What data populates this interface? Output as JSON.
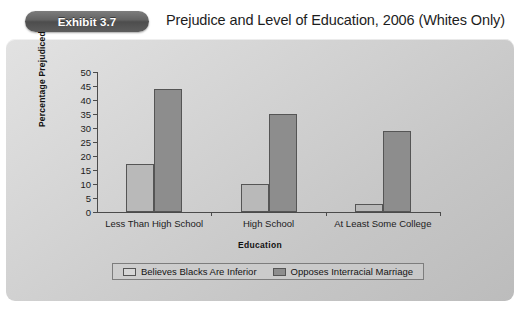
{
  "header": {
    "badge_label": "Exhibit 3.7",
    "title": "Prejudice and Level of Education, 2006 (Whites Only)"
  },
  "legend": {
    "items": [
      {
        "label": "Believes Blacks Are Inferior",
        "swatch": "light",
        "color": "#d6d6d6"
      },
      {
        "label": "Opposes Interracial Marriage",
        "swatch": "dark",
        "color": "#8d8d8d"
      }
    ]
  },
  "colors": {
    "panel_background": "#d2d2d2",
    "bar_light": "#b9b9b9",
    "bar_dark": "#8d8d8d",
    "axis": "#4b4b4b",
    "badge": "#5d5d5d"
  },
  "chart_data": {
    "type": "bar",
    "title": "Prejudice and Level of Education, 2006 (Whites Only)",
    "xlabel": "Education",
    "ylabel": "Percentage Prejudiced",
    "ylim": [
      0,
      50
    ],
    "yticks": [
      0,
      5,
      10,
      15,
      20,
      25,
      30,
      35,
      40,
      45,
      50
    ],
    "ytick_labels": [
      "0",
      "5",
      "10",
      "15",
      "20",
      "25",
      "30",
      "35",
      "40",
      "45",
      "50"
    ],
    "grid": false,
    "legend_position": "bottom",
    "categories": [
      "Less Than High School",
      "High School",
      "At Least Some College"
    ],
    "series": [
      {
        "name": "Believes Blacks Are Inferior",
        "values": [
          17,
          10,
          3
        ]
      },
      {
        "name": "Opposes Interracial Marriage",
        "values": [
          44,
          35,
          29
        ]
      }
    ]
  }
}
